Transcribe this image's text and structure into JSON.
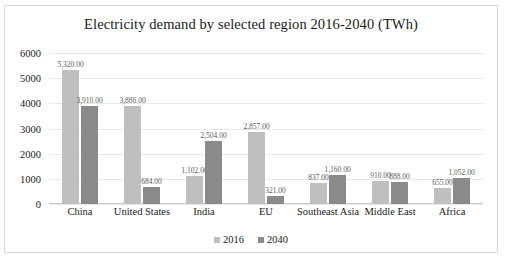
{
  "chart_data": {
    "type": "bar",
    "title": "Electricity demand by selected region 2016-2040 (TWh)",
    "xlabel": "",
    "ylabel": "",
    "ylim": [
      0,
      6000
    ],
    "yticks": [
      6000,
      5000,
      4000,
      3000,
      2000,
      1000,
      0
    ],
    "ytick_labels": [
      "6000",
      "5000",
      "4000",
      "3000",
      "2000",
      "1000",
      "0"
    ],
    "grid": true,
    "legend_position": "bottom",
    "categories": [
      "China",
      "United States",
      "India",
      "EU",
      "Southeast Asia",
      "Middle East",
      "Africa"
    ],
    "series": [
      {
        "name": "2016",
        "color": "#bfbfbf",
        "values": [
          5320,
          3886,
          1102,
          2857,
          837,
          910,
          655
        ],
        "labels": [
          "5,320.00",
          "3,886.00",
          "1,102.00",
          "2,857.00",
          "837.00",
          "910.00",
          "655.00"
        ]
      },
      {
        "name": "2040",
        "color": "#8a8a8a",
        "values": [
          3910,
          684,
          2504,
          321,
          1160,
          888,
          1052
        ],
        "labels": [
          "3,910.00",
          "684.00",
          "2,504.00",
          "321.00",
          "1,160.00",
          "888.00",
          "1,052.00"
        ]
      }
    ]
  }
}
